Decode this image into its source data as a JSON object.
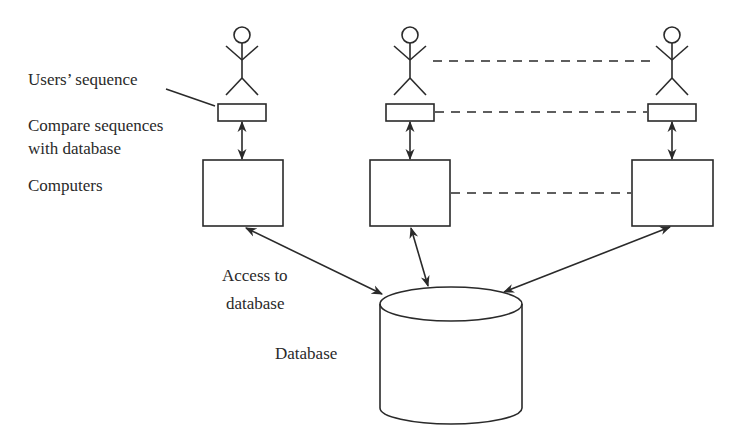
{
  "diagram": {
    "labels": {
      "users_sequence": "Users’ sequence",
      "compare_line1": "Compare sequences",
      "compare_line2": "with database",
      "computers": "Computers",
      "access_line1": "Access to",
      "access_line2": "database",
      "database": "Database"
    },
    "nodes": [
      {
        "id": "user-1",
        "type": "actor"
      },
      {
        "id": "user-2",
        "type": "actor"
      },
      {
        "id": "user-3",
        "type": "actor"
      },
      {
        "id": "sequence-1",
        "type": "rect"
      },
      {
        "id": "sequence-2",
        "type": "rect"
      },
      {
        "id": "sequence-3",
        "type": "rect"
      },
      {
        "id": "computer-1",
        "type": "box"
      },
      {
        "id": "computer-2",
        "type": "box"
      },
      {
        "id": "computer-3",
        "type": "box"
      },
      {
        "id": "database",
        "type": "cylinder"
      }
    ],
    "edges": [
      {
        "from": "sequence-1",
        "to": "computer-1",
        "style": "double-arrow"
      },
      {
        "from": "sequence-2",
        "to": "computer-2",
        "style": "double-arrow"
      },
      {
        "from": "sequence-3",
        "to": "computer-3",
        "style": "double-arrow"
      },
      {
        "from": "computer-1",
        "to": "database",
        "style": "double-arrow"
      },
      {
        "from": "computer-2",
        "to": "database",
        "style": "double-arrow"
      },
      {
        "from": "computer-3",
        "to": "database",
        "style": "double-arrow"
      },
      {
        "from": "user-2",
        "to": "user-3",
        "style": "dashed"
      },
      {
        "from": "sequence-2",
        "to": "sequence-3",
        "style": "dashed"
      },
      {
        "from": "computer-2",
        "to": "computer-3",
        "style": "dashed"
      }
    ],
    "colors": {
      "stroke": "#2a2a2a",
      "background": "#ffffff"
    }
  }
}
